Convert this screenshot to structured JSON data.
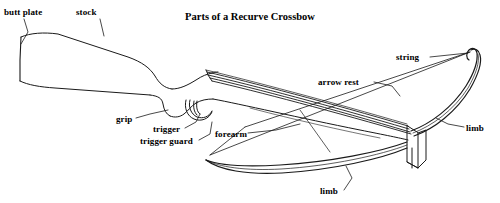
{
  "diagram": {
    "title": "Parts of a Recurve Crossbow",
    "background_color": "#ffffff",
    "stroke_color": "#1a1a1a",
    "labels": [
      {
        "id": "butt-plate",
        "text": "butt plate"
      },
      {
        "id": "stock",
        "text": "stock"
      },
      {
        "id": "string",
        "text": "string"
      },
      {
        "id": "arrow-rest",
        "text": "arrow rest"
      },
      {
        "id": "grip",
        "text": "grip"
      },
      {
        "id": "trigger",
        "text": "trigger"
      },
      {
        "id": "forearm",
        "text": "forearm"
      },
      {
        "id": "trigger-guard",
        "text": "trigger guard"
      },
      {
        "id": "limb-right",
        "text": "limb"
      },
      {
        "id": "limb-bottom",
        "text": "limb"
      }
    ]
  }
}
